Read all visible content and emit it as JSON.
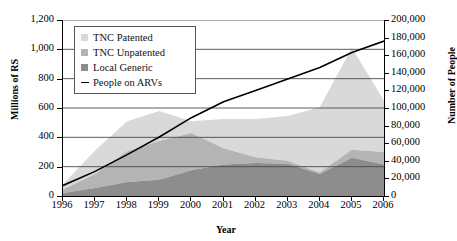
{
  "chart_data": {
    "type": "area",
    "title": "",
    "xlabel": "Year",
    "ylabel": "Millions of RS",
    "y2label": "Number of People",
    "categories": [
      "1996",
      "1997",
      "1998",
      "1999",
      "2000",
      "2001",
      "2002",
      "2003",
      "2004",
      "2005",
      "2006"
    ],
    "ylim": [
      0,
      1200
    ],
    "y2lim": [
      0,
      200000
    ],
    "yticks": [
      "0",
      "200",
      "400",
      "600",
      "800",
      "1,000",
      "1,200"
    ],
    "y2ticks": [
      "0",
      "20,000",
      "40,000",
      "60,000",
      "80,000",
      "100,000",
      "120,000",
      "140,000",
      "160,000",
      "180,000",
      "200,000"
    ],
    "grid": true,
    "legend_position": "top-left",
    "stacked": true,
    "series": [
      {
        "name": "Local Generic",
        "color": "#8d8d8d",
        "kind": "area",
        "axis": "left",
        "values": [
          20,
          55,
          95,
          110,
          175,
          215,
          225,
          220,
          150,
          260,
          215
        ]
      },
      {
        "name": "TNC Unpatented",
        "color": "#b4b4b4",
        "kind": "area",
        "axis": "left",
        "values": [
          25,
          95,
          210,
          265,
          255,
          110,
          40,
          20,
          10,
          55,
          85
        ]
      },
      {
        "name": "TNC Patented",
        "color": "#d9d9d9",
        "kind": "area",
        "axis": "left",
        "values": [
          35,
          160,
          205,
          205,
          80,
          200,
          260,
          305,
          445,
          695,
          350
        ]
      },
      {
        "name": "People on ARVs",
        "color": "#000000",
        "kind": "line",
        "axis": "right",
        "values": [
          12000,
          28000,
          47000,
          67000,
          89000,
          107000,
          120000,
          133000,
          146000,
          163000,
          176000
        ]
      }
    ]
  },
  "legend": {
    "items": [
      {
        "label": "TNC Patented",
        "marker": "square",
        "color": "#d9d9d9"
      },
      {
        "label": "TNC Unpatented",
        "marker": "square",
        "color": "#b4b4b4"
      },
      {
        "label": "Local Generic",
        "marker": "square",
        "color": "#8d8d8d"
      },
      {
        "label": "People on ARVs",
        "marker": "line",
        "color": "#000000"
      }
    ]
  }
}
